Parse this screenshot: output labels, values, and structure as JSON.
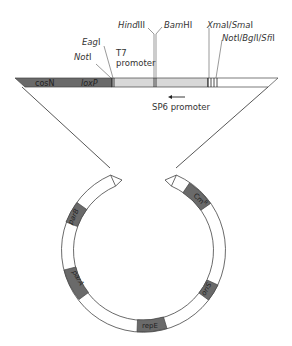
{
  "figure": {
    "colors": {
      "dark_region": "#6a6a6a",
      "light_region": "#d8d8d8",
      "white_region": "#ffffff",
      "line": "#444444"
    },
    "vector_bar": {
      "regions": [
        {
          "label": "cosN"
        },
        {
          "label": "loxP"
        }
      ]
    },
    "restriction_sites": [
      {
        "label_italic": "Not",
        "label_roman": "I"
      },
      {
        "label_italic": "Eag",
        "label_roman": "I"
      },
      {
        "label_italic": "Hind",
        "label_roman": "III"
      },
      {
        "label_italic": "Bam",
        "label_roman": "HI"
      },
      {
        "label_italic": "Xma",
        "label_roman": "I/",
        "label_italic2": "Sma",
        "label_roman2": "I"
      },
      {
        "label_italic": "Not",
        "label_roman": "I/",
        "label_italic2": "Bgl",
        "label_roman2": "I/",
        "label_italic3": "Sfi",
        "label_roman3": "I"
      }
    ],
    "promoters": {
      "t7_line1": "T7",
      "t7_line2": "promoter",
      "sp6": "SP6 promoter",
      "sp6_arrow": "left-arrow"
    },
    "plasmid_segments": [
      {
        "label": "Cm",
        "superscript": "R"
      },
      {
        "label": "oriS"
      },
      {
        "label": "repE"
      },
      {
        "label": "parA"
      },
      {
        "label": "parB"
      }
    ]
  }
}
